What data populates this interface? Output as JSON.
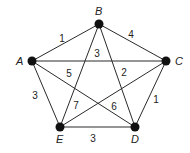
{
  "graph": {
    "nodes": [
      {
        "id": "A",
        "label": "A",
        "x": 32,
        "y": 61,
        "lx": 16,
        "ly": 65
      },
      {
        "id": "B",
        "label": "B",
        "x": 99,
        "y": 24,
        "lx": 95,
        "ly": 15
      },
      {
        "id": "C",
        "label": "C",
        "x": 166,
        "y": 61,
        "lx": 175,
        "ly": 65
      },
      {
        "id": "D",
        "label": "D",
        "x": 135,
        "y": 127,
        "lx": 131,
        "ly": 143
      },
      {
        "id": "E",
        "label": "E",
        "x": 60,
        "y": 127,
        "lx": 56,
        "ly": 143
      }
    ],
    "edges": [
      {
        "from": "A",
        "to": "B",
        "weight": "1",
        "lx": 62,
        "ly": 42
      },
      {
        "from": "B",
        "to": "C",
        "weight": "4",
        "lx": 131,
        "ly": 38
      },
      {
        "from": "A",
        "to": "C",
        "weight": "3",
        "lx": 97,
        "ly": 57
      },
      {
        "from": "A",
        "to": "D",
        "weight": "6",
        "lx": 114,
        "ly": 110
      },
      {
        "from": "A",
        "to": "E",
        "weight": "3",
        "lx": 35,
        "ly": 99
      },
      {
        "from": "B",
        "to": "E",
        "weight": "5",
        "lx": 69,
        "ly": 77
      },
      {
        "from": "B",
        "to": "D",
        "weight": "2",
        "lx": 124,
        "ly": 76
      },
      {
        "from": "C",
        "to": "E",
        "weight": "7",
        "lx": 76,
        "ly": 109
      },
      {
        "from": "C",
        "to": "D",
        "weight": "1",
        "lx": 156,
        "ly": 103
      },
      {
        "from": "E",
        "to": "D",
        "weight": "3",
        "lx": 93,
        "ly": 142
      }
    ]
  }
}
